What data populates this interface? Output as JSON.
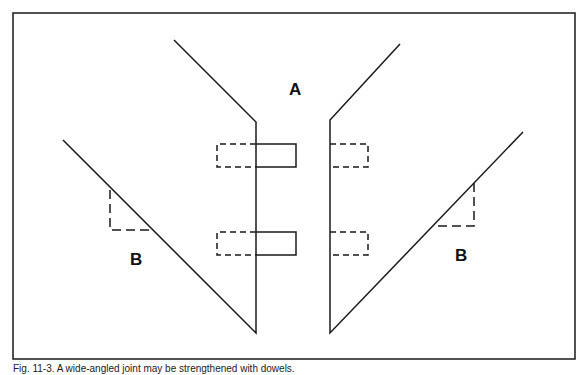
{
  "figure": {
    "labels": {
      "center": "A",
      "left": "B",
      "right": "B"
    },
    "colors": {
      "line": "#1a1a1a",
      "background": "#ffffff"
    }
  },
  "caption": "Fig. 11-3. A wide-angled joint may be strengthened with dowels."
}
